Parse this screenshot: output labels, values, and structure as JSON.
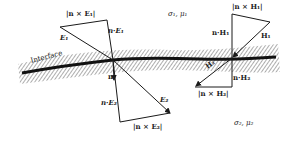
{
  "diagram": {
    "type": "boundary-conditions-figure",
    "interface_label": "Interface",
    "regions": {
      "upper": {
        "label": "σ₁, μ₁"
      },
      "lower": {
        "label": "σ₂, μ₂"
      }
    },
    "normal_label": "n",
    "electric": {
      "E1_label": "E₁",
      "E2_top_label": "E₁",
      "n_cross_E1": "|n × E₁|",
      "n_dot_E1": "n·E₁",
      "E2_label": "E₂",
      "n_dot_E2": "n·E₂",
      "n_cross_E2": "|n × E₂|"
    },
    "magnetic": {
      "H1_label": "H₁",
      "n_cross_H1": "|n × H₁|",
      "n_dot_H1": "n·H₁",
      "H2_label": "H₂",
      "n_dot_H2": "n·H₂",
      "n_cross_H2": "|n × H₂|"
    },
    "colors": {
      "ink": "#1a1a1a",
      "background": "#ffffff"
    }
  }
}
